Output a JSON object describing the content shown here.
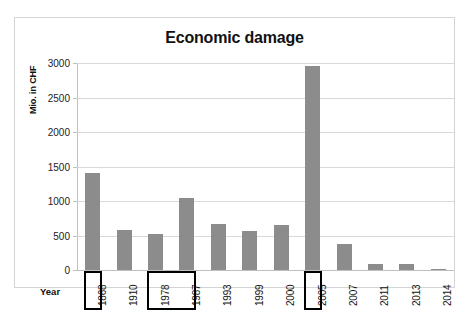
{
  "chart_data": {
    "type": "bar",
    "title": "Economic damage",
    "xlabel": "Year",
    "ylabel": "Mio. in CHF",
    "categories": [
      "1868",
      "1910",
      "1978",
      "1987",
      "1993",
      "1999",
      "2000",
      "2005",
      "2007",
      "2011",
      "2013",
      "2014"
    ],
    "values": [
      1400,
      580,
      515,
      1045,
      660,
      570,
      655,
      2960,
      370,
      80,
      85,
      15
    ],
    "ylim": [
      0,
      3000
    ],
    "yticks": [
      0,
      500,
      1000,
      1500,
      2000,
      2500,
      3000
    ],
    "ytick_labels": [
      "0",
      "500",
      "1000",
      "1500",
      "2000",
      "2500",
      "3000"
    ],
    "grid": true,
    "legend": false,
    "bar_color": "#8c8c8c",
    "highlighted_categories": [
      "1868",
      "1978",
      "1987",
      "2005"
    ],
    "annotations": [
      {
        "label": "1868",
        "type": "boxed-xlabel"
      },
      {
        "label": "1978-1987",
        "type": "boxed-xlabel-group"
      },
      {
        "label": "2005",
        "type": "boxed-xlabel"
      }
    ]
  },
  "colors": {
    "bar": "#8c8c8c",
    "gridline": "#d9d9d9",
    "axis": "#bfbfbf",
    "frame": "#d4d4d4",
    "highlight_outline": "#000000",
    "text": "#111111"
  }
}
